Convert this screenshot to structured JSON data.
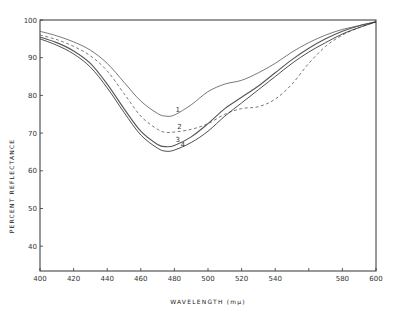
{
  "chart_data": {
    "type": "line",
    "title": "",
    "xlabel": "WAVELENGTH (mμ)",
    "ylabel": "PERCENT REFLECTANCE",
    "xlim": [
      400,
      600
    ],
    "ylim": [
      33,
      100
    ],
    "xticks": [
      400,
      420,
      440,
      460,
      480,
      500,
      520,
      540,
      560,
      580,
      600
    ],
    "xtick_labels": [
      "400",
      "420",
      "440",
      "460",
      "480",
      "500",
      "520",
      "540",
      "580",
      "600"
    ],
    "yticks": [
      40,
      50,
      60,
      70,
      80,
      90,
      100
    ],
    "grid": false,
    "legend": "inline curve numbers",
    "x": [
      400,
      410,
      420,
      430,
      440,
      450,
      460,
      470,
      475,
      480,
      490,
      500,
      510,
      520,
      530,
      540,
      550,
      560,
      570,
      580,
      590,
      600
    ],
    "series": [
      {
        "name": "1",
        "style": "solid",
        "values": [
          97,
          95.8,
          94.2,
          92,
          88.5,
          83.5,
          78.5,
          75.2,
          74.5,
          74.8,
          77.5,
          81,
          83,
          84,
          86,
          88.5,
          91.5,
          94,
          96,
          97.5,
          98.5,
          99.5
        ]
      },
      {
        "name": "2",
        "style": "dashed",
        "values": [
          96,
          94.8,
          93,
          90.5,
          86.5,
          80.5,
          74.5,
          71,
          70.2,
          70.3,
          71,
          72.5,
          75,
          76.5,
          77,
          79,
          83,
          88.5,
          93,
          96,
          98,
          99.5
        ]
      },
      {
        "name": "3",
        "style": "solid",
        "values": [
          95.5,
          94,
          91.8,
          88.5,
          83,
          76.5,
          70.5,
          67,
          66.4,
          66.7,
          69,
          72.5,
          76.5,
          79.5,
          82.5,
          86,
          89.5,
          92.5,
          95,
          97,
          98.5,
          99.5
        ]
      },
      {
        "name": "4",
        "style": "solid",
        "values": [
          95,
          93.3,
          91,
          87.5,
          82,
          75.5,
          69.5,
          66,
          65.2,
          65.5,
          67.5,
          70.5,
          74.5,
          78,
          81.5,
          85,
          88.5,
          91.5,
          94,
          96.3,
          98,
          99.5
        ]
      }
    ],
    "annotations": [
      {
        "text": "1",
        "x": 482,
        "y": 75.5
      },
      {
        "text": "2",
        "x": 483,
        "y": 71.2
      },
      {
        "text": "3",
        "x": 482,
        "y": 67.6
      },
      {
        "text": "4",
        "x": 485,
        "y": 66.2
      }
    ]
  }
}
